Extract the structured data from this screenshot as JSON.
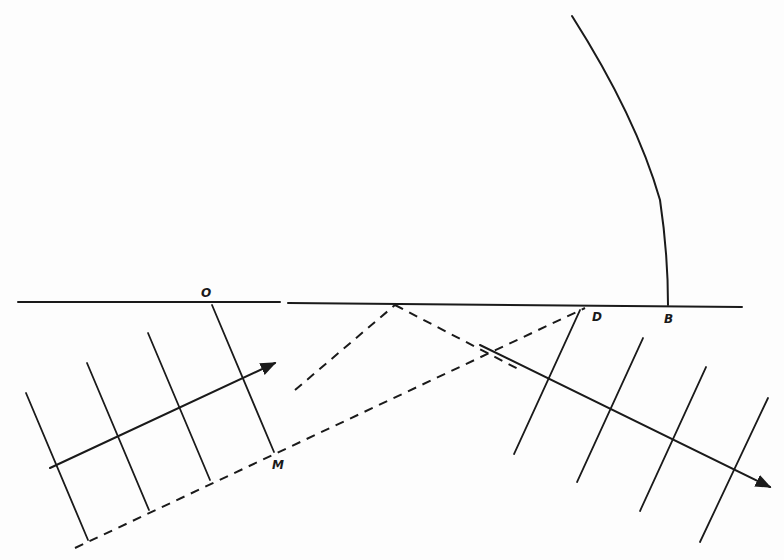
{
  "diagram": {
    "type": "wave-reflection-construction",
    "labels": {
      "O": "O",
      "M": "M",
      "D": "D",
      "B": "B"
    },
    "colors": {
      "ink": "#1a1a1a",
      "paper": "#fdfdfd"
    }
  }
}
